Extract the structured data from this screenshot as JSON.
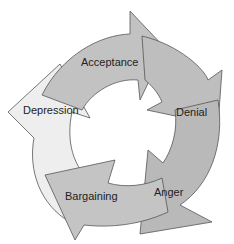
{
  "diagram": {
    "type": "cycle",
    "direction": "clockwise",
    "stages": [
      {
        "label": "Acceptance",
        "fill": "#c2c2c2"
      },
      {
        "label": "Denial",
        "fill": "#bebebe"
      },
      {
        "label": "Anger",
        "fill": "#b9b9b9"
      },
      {
        "label": "Bargaining",
        "fill": "#c4c4c4"
      },
      {
        "label": "Depression",
        "fill": "#eeeeee"
      }
    ],
    "colors": {
      "outline": "#555555",
      "background": "#ffffff",
      "text": "#222222"
    }
  }
}
